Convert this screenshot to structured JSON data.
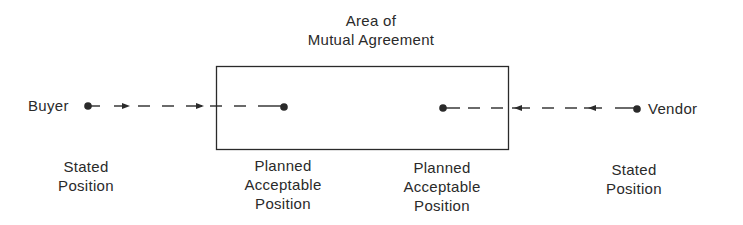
{
  "title": {
    "line1": "Area of",
    "line2": "Mutual Agreement"
  },
  "parties": {
    "buyer": "Buyer",
    "vendor": "Vendor"
  },
  "positions": {
    "buyer_stated": {
      "line1": "Stated",
      "line2": "Position"
    },
    "buyer_planned": {
      "line1": "Planned",
      "line2": "Acceptable",
      "line3": "Position"
    },
    "vendor_planned": {
      "line1": "Planned",
      "line2": "Acceptable",
      "line3": "Position"
    },
    "vendor_stated": {
      "line1": "Stated",
      "line2": "Position"
    }
  },
  "colors": {
    "ink": "#2a2a2a",
    "background": "#ffffff"
  }
}
